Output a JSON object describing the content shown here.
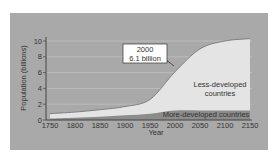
{
  "chart_data": {
    "type": "area",
    "title": "",
    "xlabel": "Year",
    "ylabel": "Population (billions)",
    "xlim": [
      1750,
      2150
    ],
    "ylim": [
      0,
      10
    ],
    "x": [
      1750,
      1800,
      1850,
      1900,
      1950,
      2000,
      2050,
      2100,
      2150
    ],
    "x_ticks": [
      "1750",
      "1800",
      "1850",
      "1900",
      "1950",
      "2000",
      "2050",
      "2100",
      "2150"
    ],
    "y_ticks": [
      "0",
      "2",
      "4",
      "6",
      "8",
      "10"
    ],
    "grid": true,
    "series": [
      {
        "name": "More-developed countries",
        "values": [
          0.2,
          0.3,
          0.4,
          0.6,
          0.8,
          1.2,
          1.2,
          1.2,
          1.2
        ],
        "color": "#8c8c8c"
      },
      {
        "name": "Less-developed countries",
        "values": [
          0.6,
          0.7,
          0.9,
          1.1,
          1.8,
          4.9,
          7.8,
          8.8,
          9.1
        ],
        "color": "#e4e4e4"
      }
    ],
    "total": [
      0.8,
      1.0,
      1.3,
      1.7,
      2.6,
      6.1,
      9.0,
      10.0,
      10.3
    ],
    "annotations": [
      {
        "text_line1": "2000",
        "text_line2": "6.1 billion",
        "x": 2000,
        "y": 6.1
      }
    ],
    "area_labels": {
      "less_line1": "Less-developed",
      "less_line2": "countries",
      "more": "More-developed countries"
    }
  }
}
